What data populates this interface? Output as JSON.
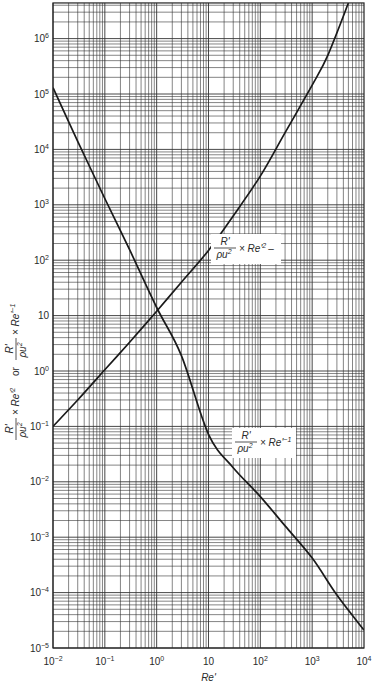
{
  "chart_data": {
    "type": "line",
    "title": "",
    "xlabel": "Re'",
    "ylabel": "R'/ρu² × Re'² or R'/ρu² × Re'⁻¹",
    "xscale": "log",
    "yscale": "log",
    "xlim": [
      0.01,
      10000
    ],
    "ylim": [
      1e-05,
      4400000
    ],
    "grid": true,
    "legend": "none (inline curve annotations)",
    "x_ticks": [
      {
        "value": 0.01,
        "base": "10",
        "exp": "−2"
      },
      {
        "value": 0.1,
        "base": "10",
        "exp": "−1"
      },
      {
        "value": 1,
        "base": "10",
        "exp": "0"
      },
      {
        "value": 10,
        "base": "10",
        "exp": ""
      },
      {
        "value": 100,
        "base": "10",
        "exp": "2"
      },
      {
        "value": 1000,
        "base": "10",
        "exp": "3"
      },
      {
        "value": 10000,
        "base": "10",
        "exp": "4"
      }
    ],
    "y_ticks": [
      {
        "value": 1000000,
        "base": "10",
        "exp": "6"
      },
      {
        "value": 100000,
        "base": "10",
        "exp": "5"
      },
      {
        "value": 10000,
        "base": "10",
        "exp": "4"
      },
      {
        "value": 1000,
        "base": "10",
        "exp": "3"
      },
      {
        "value": 100,
        "base": "10",
        "exp": "2"
      },
      {
        "value": 10,
        "base": "10",
        "exp": ""
      },
      {
        "value": 1,
        "base": "10",
        "exp": "0"
      },
      {
        "value": 0.1,
        "base": "10",
        "exp": "−1"
      },
      {
        "value": 0.01,
        "base": "10",
        "exp": "−2"
      },
      {
        "value": 0.001,
        "base": "10",
        "exp": "−3"
      },
      {
        "value": 0.0001,
        "base": "10",
        "exp": "−4"
      },
      {
        "value": 1e-05,
        "base": "10",
        "exp": "−5"
      }
    ],
    "series": [
      {
        "name": "R'/ρu² × Re'²",
        "x": [
          0.01,
          0.03,
          0.1,
          0.3,
          1,
          3,
          10,
          30,
          100,
          300,
          1000,
          2000,
          5000
        ],
        "values": [
          0.1,
          0.3,
          1.05,
          3.3,
          12,
          40,
          150,
          630,
          3300,
          20000,
          145000,
          500000,
          4400000
        ]
      },
      {
        "name": "R'/ρu² × Re'⁻¹",
        "x": [
          0.01,
          0.03,
          0.1,
          0.3,
          1,
          3,
          10,
          30,
          100,
          300,
          1000,
          3000,
          10000
        ],
        "values": [
          130000,
          14000,
          1300,
          155,
          14,
          1.9,
          0.072,
          0.018,
          0.0054,
          0.0016,
          0.00042,
          9e-05,
          2.1e-05
        ]
      }
    ],
    "annotations": [
      {
        "text": "R'/ρu² × Re'²",
        "numerator": "R'",
        "denominator": "ρu",
        "den_sup": "2",
        "suffix": "× Re'",
        "suffix_sup": "2",
        "trailing": "–",
        "near_x": 100,
        "near_y": 100
      },
      {
        "text": "R'/ρu² × Re'⁻¹",
        "numerator": "R'",
        "denominator": "ρu",
        "den_sup": "2",
        "suffix": "× Re'",
        "suffix_sup": "−1",
        "near_x": 200,
        "near_y": 0.02
      }
    ],
    "ylabel_parts": {
      "num": "R'",
      "den": "ρu",
      "den_sup": "2",
      "mid1": "× Re'",
      "mid1_sup": "2",
      "or": "or",
      "mid2": "× Re'",
      "mid2_sup": "−1"
    }
  },
  "colors": {
    "curve": "#1a1a1a",
    "grid": "#333333",
    "background": "#ffffff"
  }
}
